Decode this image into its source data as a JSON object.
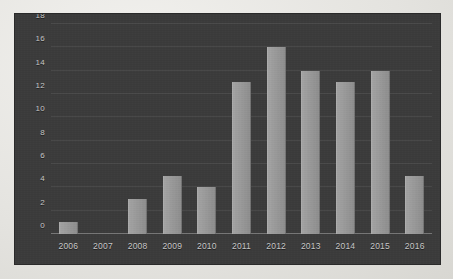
{
  "chart_data": {
    "type": "bar",
    "title": "",
    "subtitle": "",
    "xlabel": "",
    "ylabel": "",
    "categories": [
      "2006",
      "2007",
      "2008",
      "2009",
      "2010",
      "2011",
      "2012",
      "2013",
      "2014",
      "2015",
      "2016"
    ],
    "values": [
      1,
      0,
      3,
      5,
      4,
      13,
      16,
      14,
      13,
      14,
      5
    ],
    "ylim": [
      0,
      18
    ],
    "yticks": [
      0,
      2,
      4,
      6,
      8,
      10,
      12,
      14,
      16,
      18
    ],
    "ytick_labels": [
      "0",
      "2",
      "4",
      "6",
      "8",
      "10",
      "12",
      "14",
      "16",
      "18"
    ],
    "grid": true,
    "legend": false,
    "legend_position": "none",
    "colors": {
      "bar": "#9a9a9a",
      "plot_background": "#3b3b3b",
      "page_background": "#e9e8e5",
      "gridline": "#6a6a6a",
      "axis_text": "#c9c9c9",
      "baseline": "#b0b0b0"
    }
  }
}
